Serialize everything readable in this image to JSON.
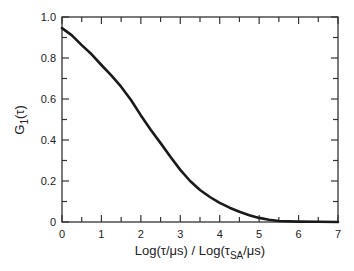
{
  "chart_data": {
    "type": "line",
    "title": "",
    "xlabel": "Log(τ/μs) / Log(τSA/μs)",
    "xlabel_parts": {
      "left": "Log(τ/μs) / Log(τ",
      "sub": "SA",
      "right": "/μs)"
    },
    "ylabel": "G1(τ)",
    "ylabel_parts": {
      "main": "G",
      "sub": "1",
      "rest": "(τ)"
    },
    "xlim": [
      0,
      7
    ],
    "ylim": [
      0,
      1.0
    ],
    "x_ticks": [
      "0",
      "1",
      "2",
      "3",
      "4",
      "5",
      "6",
      "7"
    ],
    "y_ticks": [
      "0",
      "0.2",
      "0.4",
      "0.6",
      "0.8",
      "1.0"
    ],
    "grid": false,
    "legend": null,
    "series": [
      {
        "name": "G1(τ)",
        "x": [
          0.0,
          0.25,
          0.5,
          0.75,
          1.0,
          1.25,
          1.5,
          1.75,
          2.0,
          2.25,
          2.5,
          2.75,
          3.0,
          3.25,
          3.5,
          3.75,
          4.0,
          4.25,
          4.5,
          4.75,
          5.0,
          5.25,
          5.5,
          6.0,
          6.5,
          7.0
        ],
        "values": [
          0.946,
          0.91,
          0.863,
          0.818,
          0.766,
          0.715,
          0.66,
          0.595,
          0.52,
          0.45,
          0.385,
          0.318,
          0.254,
          0.2,
          0.156,
          0.122,
          0.093,
          0.07,
          0.05,
          0.033,
          0.02,
          0.011,
          0.005,
          0.002,
          0.001,
          0.0
        ]
      }
    ]
  }
}
